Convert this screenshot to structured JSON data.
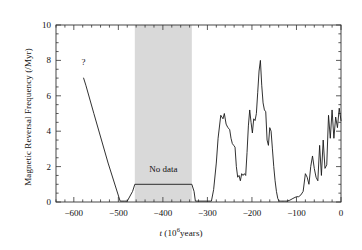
{
  "figure": {
    "background_color": "#ffffff",
    "line_color": "#1a1a1a",
    "band_color": "#d9d9d9",
    "axis_color": "#333333"
  },
  "annotations": {
    "no_data_text": "No data",
    "query_marker": "?"
  },
  "chart_data": {
    "type": "line",
    "title": "",
    "xlabel": "t (10^6 years)",
    "xlabel_parts": {
      "symbol": "t",
      "open": " (10",
      "exponent": "6",
      "close": "years)"
    },
    "ylabel": "Magnetic Reversal Frequency (/Myr)",
    "xlim": [
      -640,
      0
    ],
    "ylim": [
      0,
      10
    ],
    "xticks": [
      -600,
      -500,
      -400,
      -300,
      -200,
      -100,
      0
    ],
    "xtick_labels": [
      "−600",
      "−500",
      "−400",
      "−300",
      "−200",
      "−100",
      "0"
    ],
    "xminor_interval": 20,
    "yticks": [
      0,
      2,
      4,
      6,
      8,
      10
    ],
    "ytick_labels": [
      "0",
      "2",
      "4",
      "6",
      "8",
      "10"
    ],
    "yminor_interval": 0.5,
    "grid": false,
    "legend": null,
    "shaded_regions": [
      {
        "label": "No data",
        "x_start": -463,
        "x_end": -335,
        "color": "#d9d9d9"
      }
    ],
    "point_annotations": [
      {
        "label": "?",
        "x": -578,
        "y": 7.9
      }
    ],
    "series": [
      {
        "name": "Magnetic reversal frequency",
        "x": [
          -578,
          -573,
          -555,
          -523,
          -496,
          -487,
          -480,
          -468,
          -463,
          -335,
          -330,
          -327,
          -320,
          -300,
          -291,
          -286,
          -280,
          -276,
          -270,
          -265,
          -262,
          -258,
          -254,
          -250,
          -247,
          -244,
          -241,
          -238,
          -235,
          -232,
          -229,
          -226,
          -223,
          -220,
          -217,
          -214,
          -211,
          -208,
          -205,
          -202,
          -199,
          -196,
          -193,
          -190,
          -187,
          -184,
          -181,
          -178,
          -175,
          -172,
          -169,
          -166,
          -163,
          -160,
          -157,
          -154,
          -151,
          -148,
          -145,
          -142,
          -139,
          -136,
          -133,
          -130,
          -127,
          -124,
          -121,
          -115,
          -108,
          -100,
          -95,
          -90,
          -85,
          -80,
          -76,
          -72,
          -68,
          -64,
          -60,
          -56,
          -52,
          -48,
          -44,
          -40,
          -36,
          -32,
          -28,
          -24,
          -20,
          -16,
          -12,
          -8,
          -4,
          0
        ],
        "y": [
          7.0,
          6.6,
          5.0,
          2.2,
          0.05,
          0.05,
          0.05,
          0.6,
          1.0,
          1.0,
          0.6,
          0.05,
          0.05,
          0.05,
          0.05,
          0.7,
          2.2,
          3.6,
          4.9,
          4.7,
          5.0,
          4.4,
          4.2,
          4.1,
          3.6,
          3.3,
          3.2,
          3.1,
          2.0,
          1.4,
          1.5,
          1.2,
          1.6,
          1.5,
          1.6,
          1.5,
          2.8,
          4.3,
          5.2,
          4.5,
          3.9,
          4.7,
          4.6,
          5.0,
          6.2,
          7.4,
          8.0,
          6.6,
          5.6,
          5.2,
          5.1,
          3.5,
          3.2,
          4.2,
          4.0,
          3.0,
          2.0,
          1.2,
          0.6,
          0.2,
          0.05,
          0.05,
          0.05,
          0.05,
          0.05,
          0.05,
          0.05,
          0.1,
          0.2,
          0.3,
          0.3,
          0.4,
          0.6,
          1.6,
          1.4,
          1.0,
          2.0,
          2.6,
          1.9,
          1.4,
          1.2,
          3.2,
          1.5,
          3.5,
          1.9,
          2.1,
          4.9,
          3.6,
          5.2,
          3.6,
          4.8,
          4.2,
          5.3,
          4.6
        ]
      }
    ]
  }
}
